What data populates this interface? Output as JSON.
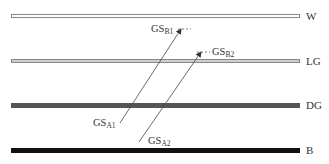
{
  "diagram": {
    "bars": [
      {
        "id": "W",
        "label": "W",
        "fill": "#ffffff",
        "stroke": "#888888",
        "y": 14,
        "h": 4
      },
      {
        "id": "LG",
        "label": "LG",
        "fill": "#cfcfcf",
        "stroke": "#888888",
        "y": 59,
        "h": 4
      },
      {
        "id": "DG",
        "label": "DG",
        "fill": "#555555",
        "stroke": "#555555",
        "y": 103,
        "h": 5
      },
      {
        "id": "B",
        "label": "B",
        "fill": "#111111",
        "stroke": "#111111",
        "y": 148,
        "h": 5
      }
    ],
    "gradients": [
      {
        "start_label": "GS",
        "start_sub": "A1",
        "end_label": "GS",
        "end_sub": "B1"
      },
      {
        "start_label": "GS",
        "start_sub": "A2",
        "end_label": "GS",
        "end_sub": "B2"
      }
    ]
  }
}
